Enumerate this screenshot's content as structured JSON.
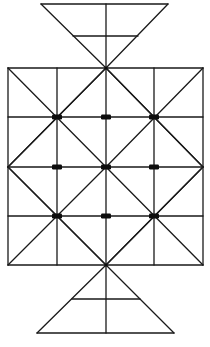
{
  "diagram": {
    "type": "board-game-lattice",
    "colors": {
      "line": "#1a1a1a",
      "marker": "#0d0d0d",
      "background": "#ffffff"
    },
    "grid": {
      "rows": 4,
      "cols": 4
    },
    "triangles": [
      {
        "name": "top",
        "subdivisions": 2
      },
      {
        "name": "bottom",
        "subdivisions": 2
      }
    ],
    "markers": [
      {
        "row": 1,
        "col": 1
      },
      {
        "row": 1,
        "col": 2
      },
      {
        "row": 1,
        "col": 3
      },
      {
        "row": 2,
        "col": 1
      },
      {
        "row": 2,
        "col": 2
      },
      {
        "row": 2,
        "col": 3
      },
      {
        "row": 3,
        "col": 1
      },
      {
        "row": 3,
        "col": 2
      },
      {
        "row": 3,
        "col": 3
      }
    ]
  }
}
